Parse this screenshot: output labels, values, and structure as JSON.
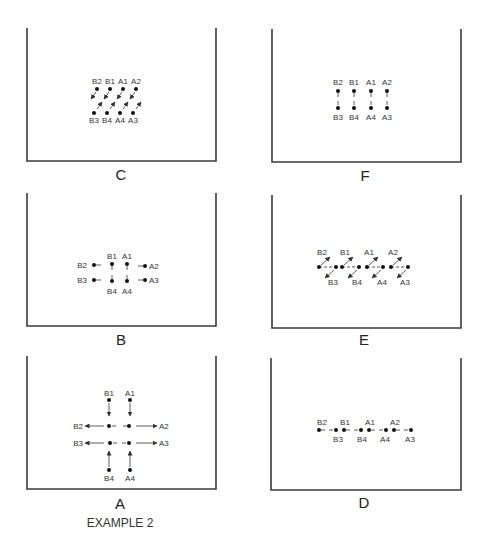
{
  "caption": "EXAMPLE 2",
  "colors": {
    "frame": "#3a3a3a",
    "dot": "#111111",
    "text": "#333333"
  },
  "panels": {
    "C": {
      "label": "C",
      "top": [
        "B2",
        "B1",
        "A1",
        "A2"
      ],
      "bottom": [
        "B3",
        "B4",
        "A4",
        "A3"
      ]
    },
    "F": {
      "label": "F",
      "top": [
        "B2",
        "B1",
        "A1",
        "A2"
      ],
      "bottom": [
        "B3",
        "B4",
        "A4",
        "A3"
      ]
    },
    "B": {
      "label": "B",
      "left": [
        "B2",
        "B3"
      ],
      "top": [
        "B1",
        "A1"
      ],
      "right": [
        "A2",
        "A3"
      ],
      "bottom": [
        "B4",
        "A4"
      ]
    },
    "E": {
      "label": "E",
      "top": [
        "B2",
        "B1",
        "A1",
        "A2"
      ],
      "bottom": [
        "B3",
        "B4",
        "A4",
        "A3"
      ]
    },
    "A": {
      "label": "A",
      "top": [
        "B1",
        "A1"
      ],
      "left": [
        "B2",
        "B3"
      ],
      "right": [
        "A2",
        "A3"
      ],
      "bottom": [
        "B4",
        "A4"
      ]
    },
    "D": {
      "label": "D",
      "top": [
        "B2",
        "B1",
        "A1",
        "A2"
      ],
      "bottom": [
        "B3",
        "B4",
        "A4",
        "A3"
      ]
    }
  }
}
